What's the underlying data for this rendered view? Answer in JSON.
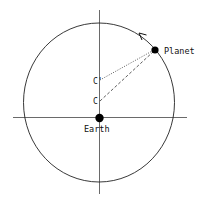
{
  "diagram": {
    "labels": {
      "planet": "Planet",
      "earth": "Earth",
      "c_prime": "C'",
      "c": "C"
    },
    "colors": {
      "stroke": "#222222",
      "dot": "#000000",
      "background": "#ffffff"
    },
    "orbit_direction": "counter-clockwise"
  }
}
